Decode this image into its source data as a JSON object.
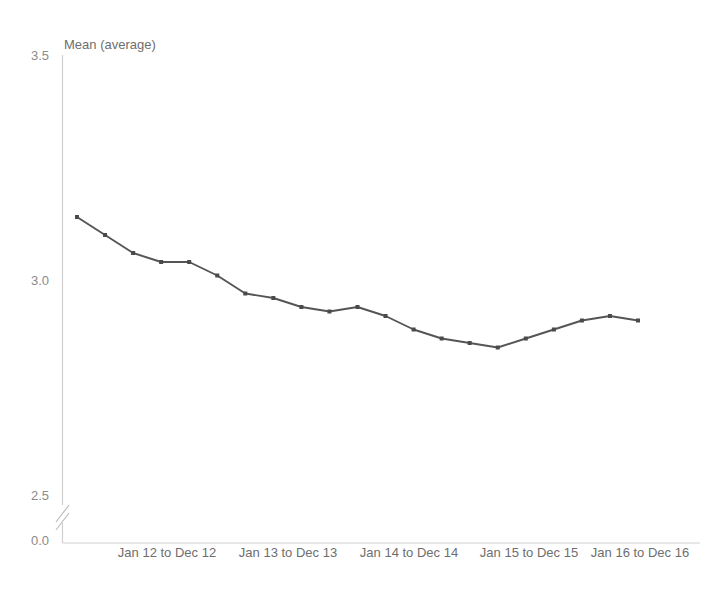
{
  "chart_data": {
    "type": "line",
    "title": "",
    "subtitle": "",
    "ylabel": "Mean (average)",
    "xlabel": "",
    "ylim": [
      2.5,
      3.5
    ],
    "y_ticks": [
      "0.0",
      "2.5",
      "3.0",
      "3.5"
    ],
    "y_tick_values": [
      0.0,
      2.5,
      3.0,
      3.5
    ],
    "axis_break": true,
    "axis_break_between": [
      0.0,
      2.5
    ],
    "grid": false,
    "legend": "none",
    "x_tick_labels": [
      "Jan 12 to Dec 12",
      "Jan 13 to Dec 13",
      "Jan 14 to Dec 14",
      "Jan 15 to Dec 15",
      "Jan 16 to Dec 16"
    ],
    "series": [
      {
        "name": "Mean (average)",
        "color": "#555555",
        "marker": "square",
        "values": [
          3.14,
          3.1,
          3.06,
          3.04,
          3.04,
          3.01,
          2.97,
          2.96,
          2.94,
          2.93,
          2.94,
          2.92,
          2.89,
          2.87,
          2.86,
          2.85,
          2.87,
          2.89,
          2.91,
          2.92,
          2.91
        ]
      }
    ],
    "colors": {
      "line": "#555555",
      "marker": "#4a4a4a",
      "axis": "#cfcfcf",
      "tick_text": "#8a8a8a",
      "label_text": "#6e6e6e",
      "background": "#ffffff"
    }
  }
}
